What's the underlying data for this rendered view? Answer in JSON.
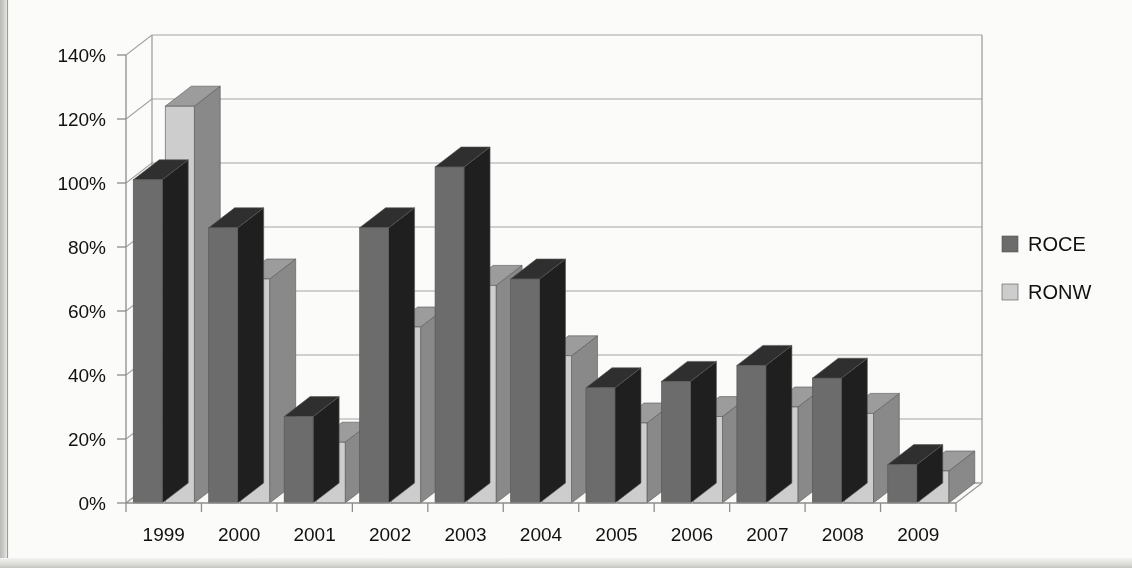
{
  "chart_data": {
    "type": "bar",
    "title": "",
    "subtitle": "",
    "xlabel": "",
    "ylabel": "",
    "categories": [
      "1999",
      "2000",
      "2001",
      "2002",
      "2003",
      "2004",
      "2005",
      "2006",
      "2007",
      "2008",
      "2009"
    ],
    "series": [
      {
        "name": "ROCE",
        "color": "#6d6d6d",
        "values": [
          101,
          86,
          27,
          86,
          105,
          70,
          36,
          38,
          43,
          39,
          12
        ]
      },
      {
        "name": "RONW",
        "color": "#cfcfcf",
        "values": [
          124,
          70,
          19,
          55,
          68,
          46,
          25,
          27,
          30,
          28,
          10
        ]
      }
    ],
    "ylim": [
      0,
      140
    ],
    "ytick_values": [
      0,
      20,
      40,
      60,
      80,
      100,
      120,
      140
    ],
    "ytick_labels": [
      "0%",
      "20%",
      "40%",
      "60%",
      "80%",
      "100%",
      "120%",
      "140%"
    ],
    "grid": true,
    "grid_axis": "y",
    "legend": [
      "ROCE",
      "RONW"
    ],
    "legend_position": "right",
    "style": "3d-column",
    "value_suffix": "%"
  },
  "legend": {
    "items": [
      {
        "label": "ROCE",
        "swatch": "dark-gray-swatch-icon"
      },
      {
        "label": "RONW",
        "swatch": "light-gray-swatch-icon"
      }
    ]
  },
  "page": {
    "background": "#fdfdfc",
    "ink": "#111111",
    "gridline_color": "#a7a7a4"
  }
}
